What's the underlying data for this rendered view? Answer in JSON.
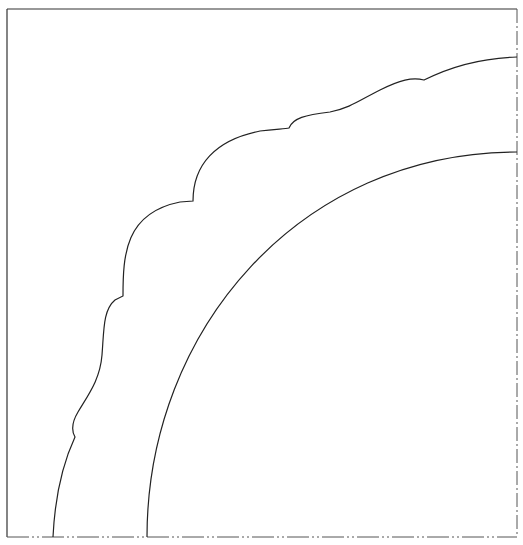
{
  "diagram": {
    "type": "technical-drawing",
    "title_text": "",
    "colors": {
      "stroke": "#222222",
      "frame": "#333333",
      "centerline": "#555555",
      "background": "#ffffff"
    },
    "frame": {
      "left_x": 7,
      "top_y": 9,
      "right_x": 517,
      "bottom_y": 537,
      "right_edge_style": "dash-dot centerline",
      "bottom_edge_style": "dash-dot centerline"
    },
    "inner_arc": {
      "start": [
        147,
        537
      ],
      "end": [
        517,
        152
      ]
    },
    "outer_contour": {
      "start": [
        53,
        537
      ],
      "end": [
        517,
        57
      ],
      "notch_points": [
        [
          75,
          437
        ],
        [
          123,
          297
        ],
        [
          193,
          201
        ],
        [
          289,
          128
        ],
        [
          424,
          80
        ]
      ]
    }
  }
}
